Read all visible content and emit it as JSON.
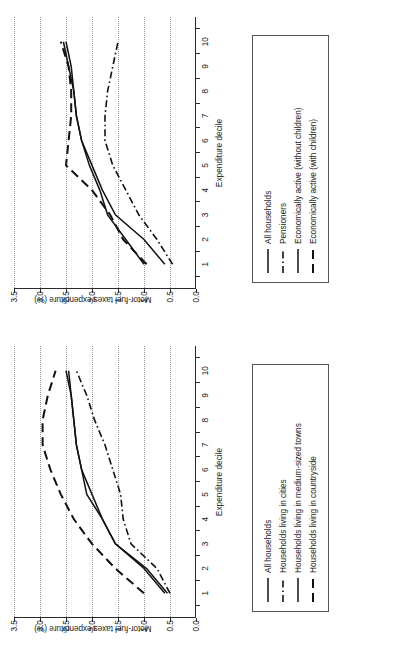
{
  "figure": {
    "background": "#ffffff",
    "line_color": "#111111",
    "grid_color": "#9a9a9a"
  },
  "axis": {
    "xlabel": "Expenditure decile",
    "ylabel": "Motor-fuel taxes/expenditure (%)",
    "xticks": [
      "1",
      "2",
      "3",
      "4",
      "5",
      "6",
      "7",
      "8",
      "9",
      "10"
    ],
    "yticks": [
      "0.0",
      "0.5",
      "1.0",
      "1.5",
      "2.0",
      "2.5",
      "3.0",
      "3.5"
    ],
    "ylim": [
      0.0,
      3.5
    ],
    "xlim": [
      1,
      10
    ],
    "grid": "horizontal-dotted"
  },
  "chart_data": [
    {
      "type": "line",
      "title": "",
      "xlabel": "Expenditure decile",
      "ylabel": "Motor-fuel taxes/expenditure (%)",
      "x": [
        1,
        2,
        3,
        4,
        5,
        6,
        7,
        8,
        9,
        10
      ],
      "xticklabels": [
        "1",
        "2",
        "3",
        "4",
        "5",
        "6",
        "7",
        "8",
        "9",
        "10"
      ],
      "ylim": [
        0.0,
        3.5
      ],
      "yticklabels": [
        "0.0",
        "0.5",
        "1.0",
        "1.5",
        "2.0",
        "2.5",
        "3.0",
        "3.5"
      ],
      "grid": true,
      "legend_position": "below-plot",
      "series": [
        {
          "name": "All households",
          "style": "solid",
          "values": [
            0.6,
            1.0,
            1.55,
            1.8,
            2.0,
            2.2,
            2.3,
            2.35,
            2.4,
            2.5
          ]
        },
        {
          "name": "Households living in cities",
          "style": "dashdot",
          "values": [
            0.5,
            0.75,
            1.25,
            1.4,
            1.45,
            1.6,
            1.75,
            1.95,
            2.1,
            2.3
          ]
        },
        {
          "name": "Households living in medium-sized towns",
          "style": "solid",
          "values": [
            0.55,
            0.95,
            1.55,
            1.8,
            2.1,
            2.2,
            2.3,
            2.35,
            2.4,
            2.45
          ]
        },
        {
          "name": "Households living in countryside",
          "style": "dashed",
          "values": [
            1.0,
            1.55,
            2.0,
            2.35,
            2.6,
            2.8,
            2.95,
            2.95,
            2.85,
            2.7
          ]
        }
      ]
    },
    {
      "type": "line",
      "title": "",
      "xlabel": "Expenditure decile",
      "ylabel": "Motor-fuel taxes/expenditure (%)",
      "x": [
        1,
        2,
        3,
        4,
        5,
        6,
        7,
        8,
        9,
        10
      ],
      "xticklabels": [
        "1",
        "2",
        "3",
        "4",
        "5",
        "6",
        "7",
        "8",
        "9",
        "10"
      ],
      "ylim": [
        0.0,
        3.5
      ],
      "yticklabels": [
        "0.0",
        "0.5",
        "1.0",
        "1.5",
        "2.0",
        "2.5",
        "3.0",
        "3.5"
      ],
      "grid": true,
      "legend_position": "below-plot",
      "series": [
        {
          "name": "All households",
          "style": "solid",
          "values": [
            0.6,
            1.0,
            1.55,
            1.8,
            2.0,
            2.2,
            2.3,
            2.35,
            2.4,
            2.5
          ]
        },
        {
          "name": "Pensioners",
          "style": "dashdot",
          "values": [
            0.45,
            0.75,
            1.1,
            1.35,
            1.6,
            1.75,
            1.75,
            1.7,
            1.6,
            1.5
          ]
        },
        {
          "name": "Economically active (without children)",
          "style": "solid",
          "values": [
            1.0,
            1.35,
            1.7,
            1.85,
            2.05,
            2.2,
            2.3,
            2.35,
            2.45,
            2.55
          ]
        },
        {
          "name": "Economically active (with children)",
          "style": "dashed",
          "values": [
            0.95,
            1.4,
            1.65,
            2.0,
            2.5,
            2.45,
            2.4,
            2.4,
            2.45,
            2.6
          ]
        }
      ]
    }
  ],
  "panels": [
    {
      "id": "panel-households-by-location",
      "legend": {
        "items": [
          {
            "label": "All households",
            "style": "solid"
          },
          {
            "label": "Households living in cities",
            "style": "dashdot"
          },
          {
            "label": "Households living in medium-sized towns",
            "style": "solid"
          },
          {
            "label": "Households living in countryside",
            "style": "dashed"
          }
        ]
      }
    },
    {
      "id": "panel-households-by-type",
      "legend": {
        "items": [
          {
            "label": "All households",
            "style": "solid"
          },
          {
            "label": "Pensioners",
            "style": "dashdot"
          },
          {
            "label": "Economically active (without children)",
            "style": "solid"
          },
          {
            "label": "Economically active (with children)",
            "style": "dashed"
          }
        ]
      }
    }
  ]
}
